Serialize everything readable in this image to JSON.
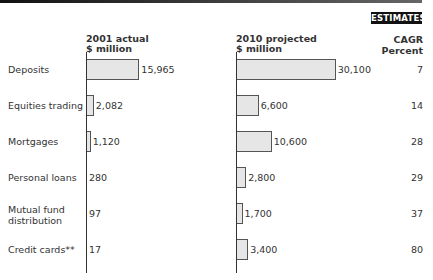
{
  "header": {
    "badge": "ESTIMATES",
    "col1_line1": "2001 actual",
    "col1_line2": "$ million",
    "col2_line1": "2010 projected",
    "col2_line2": "$ million",
    "col3_line1": "CAGR",
    "col3_line2": "Percent"
  },
  "rows": [
    {
      "label": "Deposits",
      "actual": "15,965",
      "projected": "30,100",
      "cagr": "7"
    },
    {
      "label": "Equities trading",
      "actual": "2,082",
      "projected": "6,600",
      "cagr": "14"
    },
    {
      "label": "Mortgages",
      "actual": "1,120",
      "projected": "10,600",
      "cagr": "28"
    },
    {
      "label": "Personal loans",
      "actual": "280",
      "projected": "2,800",
      "cagr": "29"
    },
    {
      "label": "Mutual fund distribution",
      "actual": "97",
      "projected": "1,700",
      "cagr": "37"
    },
    {
      "label": "Credit cards**",
      "actual": "17",
      "projected": "3,400",
      "cagr": "80"
    }
  ],
  "chart_data": {
    "type": "bar",
    "orientation": "horizontal",
    "title": "",
    "badge": "ESTIMATES",
    "categories": [
      "Deposits",
      "Equities trading",
      "Mortgages",
      "Personal loans",
      "Mutual fund distribution",
      "Credit cards**"
    ],
    "series": [
      {
        "name": "2001 actual ($ million)",
        "values": [
          15965,
          2082,
          1120,
          280,
          97,
          17
        ]
      },
      {
        "name": "2010 projected ($ million)",
        "values": [
          30100,
          6600,
          10600,
          2800,
          1700,
          3400
        ]
      }
    ],
    "extra_column": {
      "name": "CAGR Percent",
      "values": [
        7,
        14,
        28,
        29,
        37,
        80
      ]
    },
    "xlabel": "$ million",
    "ylabel": "",
    "grid": false,
    "legend": "column headers"
  }
}
